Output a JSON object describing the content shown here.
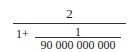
{
  "formula": {
    "numerator": "2",
    "denominator": {
      "prefix": "1+",
      "inner_fraction": {
        "numerator": "1",
        "denominator": "90 000 000 000"
      }
    }
  }
}
